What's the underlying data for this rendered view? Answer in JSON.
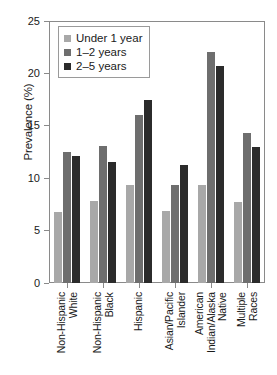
{
  "chart_data": {
    "type": "bar",
    "title": "",
    "xlabel": "",
    "ylabel": "Prevalence (%)",
    "ylim": [
      0,
      25
    ],
    "yticks": [
      0,
      5,
      10,
      15,
      20,
      25
    ],
    "grid": false,
    "legend_position": "top-left",
    "categories": [
      "Non-Hispanic\nWhite",
      "Non-Hispanic\nBlack",
      "Hispanic",
      "Asian/Pacific\nIslander",
      "American\nIndian/Alaska\nNative",
      "Multiple\nRaces"
    ],
    "series": [
      {
        "name": "Under 1 year",
        "color": "#a8a8a8",
        "values": [
          6.8,
          7.8,
          9.4,
          6.9,
          9.4,
          7.7
        ]
      },
      {
        "name": "1–2 years",
        "color": "#6e6e6e",
        "values": [
          12.5,
          13.1,
          16.0,
          9.4,
          22.0,
          14.3
        ]
      },
      {
        "name": "2–5 years",
        "color": "#2b2b2b",
        "values": [
          12.1,
          11.5,
          17.5,
          11.3,
          20.7,
          13.0
        ]
      }
    ]
  },
  "axis": {
    "frame_color": "#8a8a8a"
  }
}
